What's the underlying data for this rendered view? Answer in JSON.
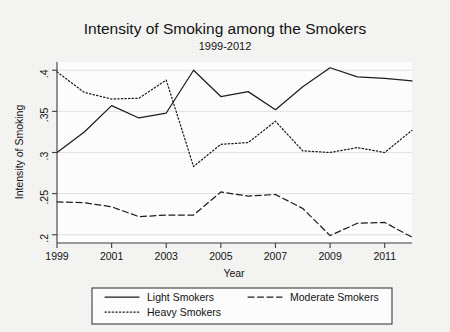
{
  "chart_data": {
    "type": "line",
    "title": "Intensity of Smoking among the Smokers",
    "subtitle": "1999-2012",
    "xlabel": "Year",
    "ylabel": "Intensity of Smoking",
    "grid": true,
    "legend_position": "bottom",
    "x": [
      1999,
      2000,
      2001,
      2002,
      2003,
      2004,
      2005,
      2006,
      2007,
      2008,
      2009,
      2010,
      2011,
      2012
    ],
    "xlim": [
      1999,
      2012
    ],
    "ylim": [
      0.19,
      0.41
    ],
    "xticks": [
      "1999",
      "2001",
      "2003",
      "2005",
      "2007",
      "2009",
      "2011"
    ],
    "xtick_values": [
      1999,
      2001,
      2003,
      2005,
      2007,
      2009,
      2011
    ],
    "yticks": [
      ".2",
      ".25",
      ".3",
      ".35",
      ".4"
    ],
    "ytick_values": [
      0.2,
      0.25,
      0.3,
      0.35,
      0.4
    ],
    "series": [
      {
        "name": "Light Smokers",
        "style": "solid",
        "values": [
          0.3,
          0.325,
          0.357,
          0.342,
          0.348,
          0.4,
          0.368,
          0.374,
          0.352,
          0.38,
          0.403,
          0.392,
          0.39,
          0.387
        ]
      },
      {
        "name": "Moderate Smokers",
        "style": "dashed",
        "values": [
          0.24,
          0.239,
          0.234,
          0.222,
          0.224,
          0.224,
          0.252,
          0.247,
          0.249,
          0.232,
          0.199,
          0.214,
          0.215,
          0.197
        ]
      },
      {
        "name": "Heavy Smokers",
        "style": "dotted",
        "values": [
          0.398,
          0.373,
          0.365,
          0.366,
          0.388,
          0.283,
          0.31,
          0.312,
          0.338,
          0.302,
          0.3,
          0.306,
          0.3,
          0.327
        ]
      }
    ]
  },
  "legend": {
    "items": [
      {
        "label": "Light Smokers",
        "style": "solid"
      },
      {
        "label": "Moderate Smokers",
        "style": "dashed"
      },
      {
        "label": "Heavy Smokers",
        "style": "dotted"
      }
    ]
  },
  "colors": {
    "line": "#1d1d1d",
    "axis": "#3b3b3b",
    "grid": "#e2e2e2",
    "plot_background": "#fdfdfd",
    "page_background": "#f4f4f2"
  }
}
